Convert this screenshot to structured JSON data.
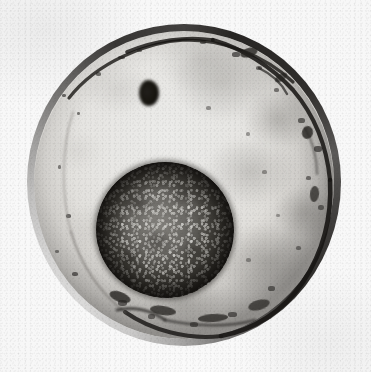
{
  "figure": {
    "kind": "photomicrograph",
    "modality": "brightfield light microscopy",
    "rendering": "grayscale halftone print",
    "caption": "",
    "width_px": 371,
    "height_px": 372
  },
  "colors": {
    "plate_background": "#f7f7f7",
    "paper_white": "#fdfdfd",
    "chorion_dark": "#1c1a18",
    "chorion_light": "#968e8a",
    "yolk_light": "#ececea",
    "yolk_mid": "#dedcd8",
    "yolk_shadow": "#343230",
    "blastodisc_light": "#6e6c68",
    "blastodisc_mid": "#474540",
    "blastodisc_dark": "#17150f",
    "debris": "#24221f"
  },
  "structures": [
    {
      "id": "chorion",
      "label": "Chorion / egg membrane",
      "shape": "ring",
      "center_x": 184,
      "center_y": 185,
      "radius_x": 157,
      "radius_y": 161,
      "rim_thickness_px": 7,
      "note": "Dark and thick along the upper-right, right and lower margins; thin and pale along the left margin."
    },
    {
      "id": "yolk",
      "label": "Yolk / cytoplasm",
      "shape": "disc",
      "center_x": 184,
      "center_y": 185,
      "radius_x": 150,
      "radius_y": 154,
      "tone": "light grey with soft cloudy mottling, darker toward the right and lower inner wall"
    },
    {
      "id": "blastodisc",
      "label": "Blastodisc / germinal disc",
      "shape": "disc",
      "center_x": 165,
      "center_y": 206,
      "radius_x": 69,
      "radius_y": 68,
      "tone": "dark grey-brown with fine light granular speckle and a heavy dark rim"
    },
    {
      "id": "blastodisc-notch",
      "label": "Dark notch on blastodisc margin",
      "shape": "blob",
      "center_x": 218,
      "center_y": 207,
      "radius_x": 10,
      "radius_y": 13
    }
  ],
  "specks": [
    {
      "x": 62,
      "y": 94,
      "w": 4,
      "h": 3,
      "o": 0.7
    },
    {
      "x": 77,
      "y": 112,
      "w": 3,
      "h": 3,
      "o": 0.62
    },
    {
      "x": 58,
      "y": 165,
      "w": 3,
      "h": 4,
      "o": 0.58
    },
    {
      "x": 66,
      "y": 214,
      "w": 5,
      "h": 4,
      "o": 0.72
    },
    {
      "x": 55,
      "y": 250,
      "w": 4,
      "h": 3,
      "o": 0.6
    },
    {
      "x": 72,
      "y": 272,
      "w": 6,
      "h": 4,
      "o": 0.74
    },
    {
      "x": 96,
      "y": 72,
      "w": 5,
      "h": 4,
      "o": 0.68
    },
    {
      "x": 118,
      "y": 56,
      "w": 7,
      "h": 3,
      "o": 0.72
    },
    {
      "x": 137,
      "y": 49,
      "w": 5,
      "h": 3,
      "o": 0.66
    },
    {
      "x": 200,
      "y": 40,
      "w": 6,
      "h": 4,
      "o": 0.7
    },
    {
      "x": 232,
      "y": 52,
      "w": 8,
      "h": 5,
      "o": 0.74
    },
    {
      "x": 256,
      "y": 66,
      "w": 6,
      "h": 4,
      "o": 0.66
    },
    {
      "x": 274,
      "y": 88,
      "w": 5,
      "h": 4,
      "o": 0.62
    },
    {
      "x": 298,
      "y": 118,
      "w": 7,
      "h": 5,
      "o": 0.7
    },
    {
      "x": 314,
      "y": 146,
      "w": 8,
      "h": 6,
      "o": 0.76
    },
    {
      "x": 306,
      "y": 176,
      "w": 5,
      "h": 4,
      "o": 0.64
    },
    {
      "x": 318,
      "y": 205,
      "w": 6,
      "h": 5,
      "o": 0.68
    },
    {
      "x": 296,
      "y": 246,
      "w": 5,
      "h": 4,
      "o": 0.6
    },
    {
      "x": 268,
      "y": 286,
      "w": 7,
      "h": 5,
      "o": 0.7
    },
    {
      "x": 228,
      "y": 312,
      "w": 9,
      "h": 5,
      "o": 0.74
    },
    {
      "x": 190,
      "y": 322,
      "w": 8,
      "h": 5,
      "o": 0.7
    },
    {
      "x": 148,
      "y": 314,
      "w": 7,
      "h": 5,
      "o": 0.66
    },
    {
      "x": 118,
      "y": 300,
      "w": 9,
      "h": 6,
      "o": 0.74
    },
    {
      "x": 206,
      "y": 106,
      "w": 5,
      "h": 4,
      "o": 0.48
    },
    {
      "x": 246,
      "y": 132,
      "w": 4,
      "h": 4,
      "o": 0.44
    },
    {
      "x": 262,
      "y": 170,
      "w": 5,
      "h": 4,
      "o": 0.46
    },
    {
      "x": 276,
      "y": 214,
      "w": 4,
      "h": 3,
      "o": 0.42
    },
    {
      "x": 246,
      "y": 258,
      "w": 5,
      "h": 4,
      "o": 0.46
    }
  ],
  "debris_marks": [
    {
      "x": 240,
      "y": 48,
      "w": 18,
      "h": 9,
      "rot": -18,
      "o": 0.78
    },
    {
      "x": 274,
      "y": 74,
      "w": 14,
      "h": 7,
      "rot": -34,
      "o": 0.66
    },
    {
      "x": 302,
      "y": 126,
      "w": 11,
      "h": 13,
      "rot": 16,
      "o": 0.8
    },
    {
      "x": 310,
      "y": 186,
      "w": 9,
      "h": 16,
      "rot": 6,
      "o": 0.72
    },
    {
      "x": 109,
      "y": 292,
      "w": 22,
      "h": 10,
      "rot": 20,
      "o": 0.8
    },
    {
      "x": 150,
      "y": 306,
      "w": 26,
      "h": 9,
      "rot": 8,
      "o": 0.76
    },
    {
      "x": 198,
      "y": 314,
      "w": 30,
      "h": 8,
      "rot": -4,
      "o": 0.74
    },
    {
      "x": 248,
      "y": 300,
      "w": 22,
      "h": 10,
      "rot": -16,
      "o": 0.7
    }
  ]
}
